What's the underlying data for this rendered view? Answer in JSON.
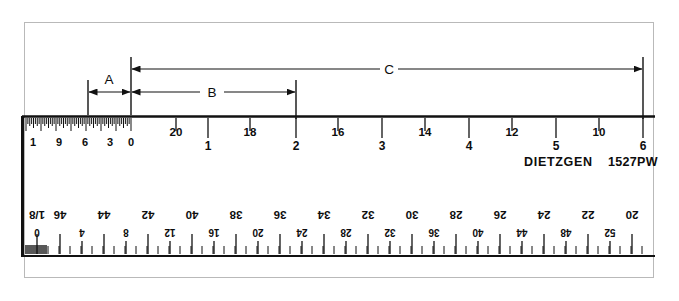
{
  "figure": {
    "kind": "engineering-scale-ruler-diagram",
    "brand": "DIETZGEN",
    "model": "1527PW",
    "border_color": "#b9b9b9",
    "ink_color": "#111111",
    "paper_color": "#ffffff"
  },
  "dimensions": {
    "a": {
      "label": "A"
    },
    "b": {
      "label": "B"
    },
    "c": {
      "label": "C"
    }
  },
  "top_scale": {
    "name": "upper-scale",
    "fine_section_labels": [
      "1",
      "9",
      "6",
      "3",
      "0"
    ],
    "upper_row_labels": [
      "20",
      "18",
      "16",
      "14",
      "12",
      "10"
    ],
    "lower_row_labels": [
      "1",
      "2",
      "3",
      "4",
      "5",
      "6"
    ]
  },
  "bottom_scale": {
    "name": "lower-scale-inverted",
    "designation": "1/8",
    "upper_row_labels": [
      "46",
      "44",
      "42",
      "40",
      "38",
      "36",
      "34",
      "32",
      "30",
      "28",
      "26",
      "24",
      "22",
      "20"
    ],
    "lower_row_labels": [
      "0",
      "4",
      "8",
      "12",
      "16",
      "20",
      "24",
      "28",
      "32",
      "36",
      "40",
      "44",
      "48",
      "52"
    ]
  },
  "chart_data": {
    "type": "table",
    "xlabel": "",
    "ylabel": "",
    "upper_scale_ticks": [
      {
        "x_px": 131,
        "upper": "0",
        "lower": ""
      },
      {
        "x_px": 176,
        "upper": "20",
        "lower": ""
      },
      {
        "x_px": 208,
        "upper": "",
        "lower": "1"
      },
      {
        "x_px": 250,
        "upper": "18",
        "lower": ""
      },
      {
        "x_px": 296,
        "upper": "",
        "lower": "2"
      },
      {
        "x_px": 338,
        "upper": "16",
        "lower": ""
      },
      {
        "x_px": 382,
        "upper": "",
        "lower": "3"
      },
      {
        "x_px": 425,
        "upper": "14",
        "lower": ""
      },
      {
        "x_px": 469,
        "upper": "",
        "lower": "4"
      },
      {
        "x_px": 512,
        "upper": "12",
        "lower": ""
      },
      {
        "x_px": 556,
        "upper": "",
        "lower": "5"
      },
      {
        "x_px": 599,
        "upper": "10",
        "lower": ""
      },
      {
        "x_px": 643,
        "upper": "",
        "lower": "6"
      }
    ],
    "lower_scale_ticks": [
      {
        "x_px": 37,
        "upper": "1/8",
        "lower": "0"
      },
      {
        "x_px": 60,
        "upper": "46",
        "lower": ""
      },
      {
        "x_px": 82,
        "upper": "",
        "lower": "4"
      },
      {
        "x_px": 104,
        "upper": "44",
        "lower": ""
      },
      {
        "x_px": 126,
        "upper": "",
        "lower": "8"
      },
      {
        "x_px": 148,
        "upper": "42",
        "lower": ""
      },
      {
        "x_px": 170,
        "upper": "",
        "lower": "12"
      },
      {
        "x_px": 192,
        "upper": "40",
        "lower": ""
      },
      {
        "x_px": 214,
        "upper": "",
        "lower": "16"
      },
      {
        "x_px": 236,
        "upper": "38",
        "lower": ""
      },
      {
        "x_px": 258,
        "upper": "",
        "lower": "20"
      },
      {
        "x_px": 280,
        "upper": "36",
        "lower": ""
      },
      {
        "x_px": 302,
        "upper": "",
        "lower": "24"
      },
      {
        "x_px": 324,
        "upper": "34",
        "lower": ""
      },
      {
        "x_px": 346,
        "upper": "",
        "lower": "28"
      },
      {
        "x_px": 368,
        "upper": "32",
        "lower": ""
      },
      {
        "x_px": 390,
        "upper": "",
        "lower": "32"
      },
      {
        "x_px": 412,
        "upper": "30",
        "lower": ""
      },
      {
        "x_px": 434,
        "upper": "",
        "lower": "36"
      },
      {
        "x_px": 456,
        "upper": "28",
        "lower": ""
      },
      {
        "x_px": 478,
        "upper": "",
        "lower": "40"
      },
      {
        "x_px": 500,
        "upper": "26",
        "lower": ""
      },
      {
        "x_px": 522,
        "upper": "",
        "lower": "44"
      },
      {
        "x_px": 544,
        "upper": "24",
        "lower": ""
      },
      {
        "x_px": 566,
        "upper": "",
        "lower": "48"
      },
      {
        "x_px": 588,
        "upper": "22",
        "lower": ""
      },
      {
        "x_px": 610,
        "upper": "",
        "lower": "52"
      },
      {
        "x_px": 632,
        "upper": "20",
        "lower": ""
      }
    ],
    "dimension_spans": [
      {
        "label": "A",
        "from_px": 88,
        "to_px": 131,
        "y_px": 92
      },
      {
        "label": "B",
        "from_px": 131,
        "to_px": 296,
        "y_px": 92
      },
      {
        "label": "C",
        "from_px": 131,
        "to_px": 643,
        "y_px": 69
      }
    ]
  }
}
